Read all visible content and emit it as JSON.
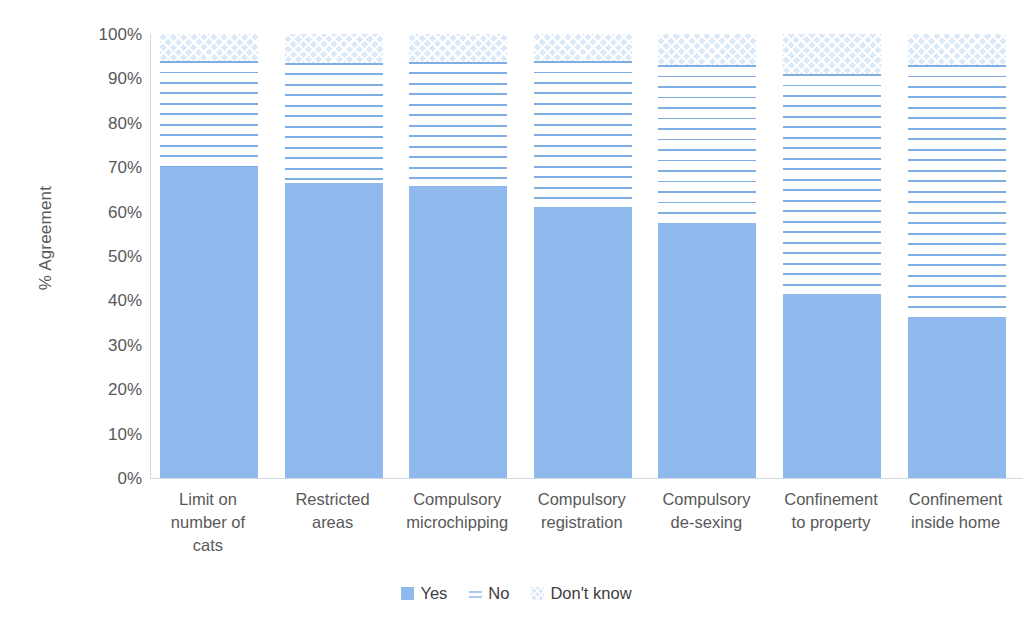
{
  "chart_data": {
    "type": "bar",
    "subtype": "stacked-column-100",
    "title": "",
    "xlabel": "",
    "ylabel": "% Agreement",
    "ylim": [
      0,
      100
    ],
    "ytick_labels": [
      "100%",
      "90%",
      "80%",
      "70%",
      "60%",
      "50%",
      "40%",
      "30%",
      "20%",
      "10%",
      "0%"
    ],
    "ytick_values": [
      100,
      90,
      80,
      70,
      60,
      50,
      40,
      30,
      20,
      10,
      0
    ],
    "grid": false,
    "legend_position": "bottom",
    "categories": [
      "Limit on number of cats",
      "Restricted areas",
      "Compulsory microchipping",
      "Compulsory registration",
      "Compulsory de-sexing",
      "Confinement to property",
      "Confinement inside home"
    ],
    "category_lines": [
      [
        "Limit on",
        "number of",
        "cats"
      ],
      [
        "Restricted",
        "areas"
      ],
      [
        "Compulsory",
        "microchipping"
      ],
      [
        "Compulsory",
        "registration"
      ],
      [
        "Compulsory",
        "de-sexing"
      ],
      [
        "Confinement",
        "to property"
      ],
      [
        "Confinement",
        "inside home"
      ]
    ],
    "series": [
      {
        "name": "Yes",
        "pattern": "solid",
        "color": "#8FB9EC",
        "values": [
          70.0,
          66.5,
          65.7,
          61.0,
          57.5,
          41.5,
          36.3
        ]
      },
      {
        "name": "No",
        "pattern": "horizontal-lines",
        "color": "#7FAEE4",
        "values": [
          24.0,
          27.0,
          28.0,
          33.0,
          35.5,
          49.5,
          56.7
        ]
      },
      {
        "name": "Don't know",
        "pattern": "cross-hatch",
        "color": "#DCE9F9",
        "values": [
          6.0,
          6.5,
          6.3,
          6.0,
          7.0,
          9.0,
          7.0
        ]
      }
    ]
  },
  "legend": {
    "items": [
      {
        "label": "Yes"
      },
      {
        "label": "No"
      },
      {
        "label": "Don't know"
      }
    ]
  }
}
